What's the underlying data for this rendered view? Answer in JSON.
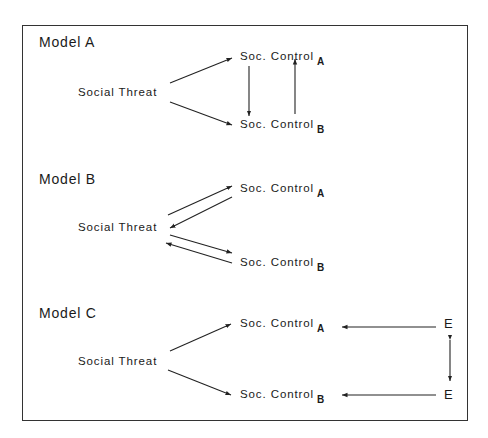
{
  "models": [
    {
      "title": "Model A",
      "source": "Social Threat",
      "node_a": {
        "label": "Soc. Control",
        "sub": "A"
      },
      "node_b": {
        "label": "Soc. Control",
        "sub": "B"
      }
    },
    {
      "title": "Model B",
      "source": "Social Threat",
      "node_a": {
        "label": "Soc. Control",
        "sub": "A"
      },
      "node_b": {
        "label": "Soc. Control",
        "sub": "B"
      }
    },
    {
      "title": "Model C",
      "source": "Social Threat",
      "node_a": {
        "label": "Soc. Control",
        "sub": "A"
      },
      "node_b": {
        "label": "Soc. Control",
        "sub": "B"
      },
      "error_a": "E",
      "error_b": "E"
    }
  ]
}
